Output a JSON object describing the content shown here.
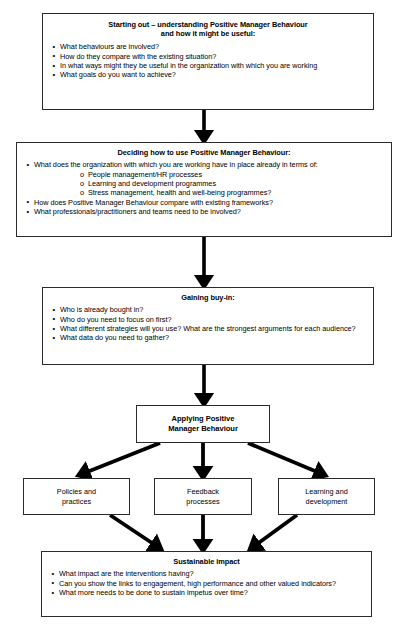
{
  "diagram": {
    "line_color": "#000000",
    "box_border_color": "#2b2b2b",
    "background_color": "#ffffff"
  },
  "nodes": {
    "starting_out": {
      "heading_line1": "Starting out – understanding Positive Manager Behaviour",
      "heading_line2": "and how it might be useful:",
      "bullets": [
        "What behaviours are involved?",
        "How do they compare with the existing situation?",
        "In what ways might they be useful in the organization with which you are working",
        "What goals do you want to achieve?"
      ]
    },
    "deciding": {
      "heading": "Deciding how to use Positive Manager Behaviour:",
      "bullet1": "What does the organization with which you are working have in place already in terms of:",
      "sub_bullets": [
        "People management/HR processes",
        "Learning and development programmes",
        "Stress management, health and well-being programmes?"
      ],
      "bullet2": "How does Positive Manager Behaviour compare with existing frameworks?",
      "bullet3": "What professionals/practitioners and teams need to be involved?"
    },
    "buy_in": {
      "heading": "Gaining buy-in:",
      "bullets": [
        "Who is already bought in?",
        "Who do you need to focus on first?",
        "What different strategies will you use? What are the strongest arguments for each audience?",
        "What data do you need to gather?"
      ]
    },
    "applying": {
      "heading_line1": "Applying Positive",
      "heading_line2": "Manager Behaviour"
    },
    "policies": {
      "label_line1": "Policies and",
      "label_line2": "practices"
    },
    "feedback": {
      "label_line1": "Feedback",
      "label_line2": "processes"
    },
    "learning": {
      "label_line1": "Learning and",
      "label_line2": "development"
    },
    "sustainable": {
      "heading": "Sustainable impact",
      "bullets": [
        "What impact are the interventions having?",
        "Can you show the links to engagement, high performance and other valued indicators?",
        "What more needs to be done to sustain impetus over time?"
      ]
    }
  }
}
